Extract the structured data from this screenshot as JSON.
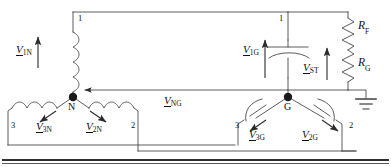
{
  "diagram": {
    "type": "electrical-schematic",
    "stroke_color": "#3a3a3a",
    "text_color": "#111111",
    "background": "#ffffff"
  },
  "nodes": [
    {
      "id": "N",
      "label": "N",
      "x": 73,
      "y": 97,
      "kind": "junction-dot"
    },
    {
      "id": "G",
      "label": "G",
      "x": 288,
      "y": 97,
      "kind": "junction-dot"
    }
  ],
  "terminals": [
    {
      "id": "t1-left",
      "label": "1",
      "x": 78,
      "y": 18
    },
    {
      "id": "t1-right",
      "label": "1",
      "x": 279,
      "y": 18
    },
    {
      "id": "t3-left",
      "label": "3",
      "x": 11,
      "y": 126
    },
    {
      "id": "t2-left",
      "label": "2",
      "x": 131,
      "y": 126
    },
    {
      "id": "t3-right",
      "label": "3",
      "x": 235,
      "y": 126
    },
    {
      "id": "t2-right",
      "label": "2",
      "x": 349,
      "y": 126
    }
  ],
  "voltages": [
    {
      "id": "v1n",
      "symbol": "V",
      "subscript": "1N",
      "x": 20,
      "y": 45,
      "arrow": "up",
      "element": "phase-1-winding"
    },
    {
      "id": "v3n",
      "symbol": "V",
      "subscript": "3N",
      "x": 39,
      "y": 124,
      "arrow": "down-left",
      "element": "phase-3-winding"
    },
    {
      "id": "v2n",
      "symbol": "V",
      "subscript": "2N",
      "x": 89,
      "y": 124,
      "arrow": "down-right",
      "element": "phase-2-winding"
    },
    {
      "id": "vng",
      "symbol": "V",
      "subscript": "NG",
      "x": 168,
      "y": 97,
      "arrow": "left",
      "element": "neutral-to-ground"
    },
    {
      "id": "v1g",
      "symbol": "V",
      "subscript": "1G",
      "x": 247,
      "y": 45,
      "arrow": "up",
      "element": "terminal-1-to-ground"
    },
    {
      "id": "vst",
      "symbol": "V",
      "subscript": "ST",
      "x": 308,
      "y": 63,
      "arrow": "up",
      "element": "secondary-tap"
    },
    {
      "id": "v3g",
      "symbol": "V",
      "subscript": "3G",
      "x": 252,
      "y": 132,
      "arrow": "down-left",
      "element": "phase-3-to-ground"
    },
    {
      "id": "v2g",
      "symbol": "V",
      "subscript": "2G",
      "x": 305,
      "y": 132,
      "arrow": "down-right",
      "element": "phase-2-to-ground"
    }
  ],
  "components": [
    {
      "id": "rf",
      "symbol": "R",
      "subscript": "F",
      "label_x": 358,
      "label_y": 24,
      "kind": "resistor",
      "orientation": "vertical"
    },
    {
      "id": "rg",
      "symbol": "R",
      "subscript": "G",
      "label_x": 358,
      "label_y": 60,
      "kind": "resistor",
      "orientation": "vertical"
    },
    {
      "id": "c-main",
      "kind": "capacitor",
      "orientation": "horizontal-plates"
    },
    {
      "id": "l1",
      "kind": "inductor",
      "phase": "1"
    },
    {
      "id": "l2",
      "kind": "inductor",
      "phase": "2"
    },
    {
      "id": "l3",
      "kind": "inductor",
      "phase": "3"
    },
    {
      "id": "c2",
      "kind": "capacitor",
      "phase": "2"
    },
    {
      "id": "c3",
      "kind": "capacitor",
      "phase": "3"
    },
    {
      "id": "ground",
      "kind": "earth-ground-symbol",
      "x": 366,
      "y": 90
    }
  ]
}
